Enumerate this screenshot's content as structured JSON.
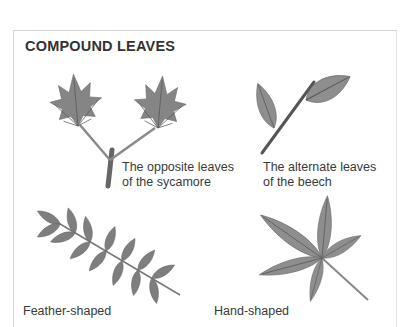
{
  "section": {
    "title": "COMPOUND LEAVES"
  },
  "illustrations": [
    {
      "name": "sycamore",
      "caption_line1": "The opposite leaves",
      "caption_line2": "of the sycamore"
    },
    {
      "name": "beech",
      "caption_line1": "The alternate leaves",
      "caption_line2": "of the beech"
    },
    {
      "name": "feather",
      "caption": "Feather-shaped"
    },
    {
      "name": "hand",
      "caption": "Hand-shaped"
    }
  ],
  "colors": {
    "leaf_fill": "#8a8a8a",
    "leaf_vein": "#5a5a5a",
    "stem": "#555555",
    "frame_border": "#d4d4d4"
  }
}
